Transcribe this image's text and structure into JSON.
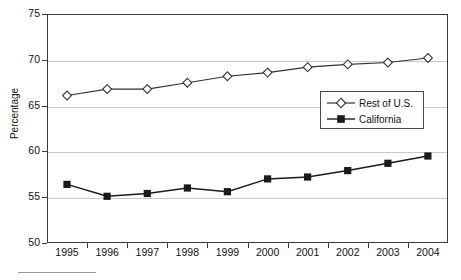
{
  "chart_data": {
    "type": "line",
    "title": "",
    "xlabel": "",
    "ylabel": "Percentage",
    "ylim": [
      50,
      75
    ],
    "ytick_labels": [
      "75",
      "70",
      "65",
      "60",
      "55",
      "50"
    ],
    "ytick_values": [
      75,
      70,
      65,
      60,
      55,
      50
    ],
    "grid": true,
    "grid_axis": "y",
    "legend_position": "center-right",
    "categories": [
      "1995",
      "1996",
      "1997",
      "1998",
      "1999",
      "2000",
      "2001",
      "2002",
      "2003",
      "2004"
    ],
    "series": [
      {
        "name": "Rest of U.S.",
        "marker": "diamond-open",
        "color": "#333333",
        "values": [
          66.1,
          66.8,
          66.8,
          67.5,
          68.2,
          68.6,
          69.2,
          69.5,
          69.7,
          70.2
        ]
      },
      {
        "name": "California",
        "marker": "square-filled",
        "color": "#1a1a1a",
        "values": [
          56.4,
          55.1,
          55.4,
          56.0,
          55.6,
          57.0,
          57.2,
          57.9,
          58.7,
          59.5
        ]
      }
    ]
  },
  "axis": {
    "y_title": "Percentage"
  },
  "legend": {
    "items": [
      {
        "label": "Rest of U.S.",
        "marker": "diamond-open-icon"
      },
      {
        "label": "California",
        "marker": "square-filled-icon"
      }
    ]
  },
  "colors": {
    "frame": "#3a3a3a",
    "grid": "#c8c8c8",
    "series_rest_of_us": "#333333",
    "series_california": "#1a1a1a",
    "text": "#111111"
  }
}
